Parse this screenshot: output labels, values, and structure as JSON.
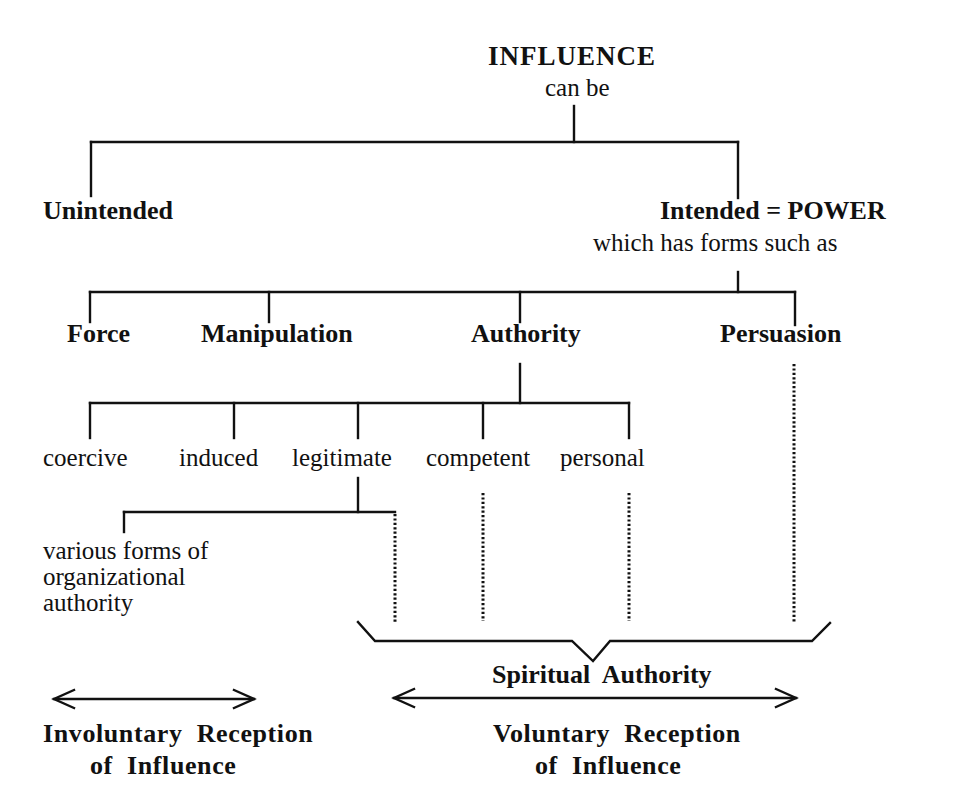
{
  "diagram": {
    "root": {
      "title": "INFLUENCE",
      "subtitle": "can be"
    },
    "level1": {
      "unintended": "Unintended",
      "intended": "Intended = POWER",
      "intended_subtitle": "which has forms such as"
    },
    "forms": [
      {
        "label": "Force"
      },
      {
        "label": "Manipulation"
      },
      {
        "label": "Authority"
      },
      {
        "label": "Persuasion"
      }
    ],
    "authority_types": [
      {
        "label": "coercive"
      },
      {
        "label": "induced"
      },
      {
        "label": "legitimate"
      },
      {
        "label": "competent"
      },
      {
        "label": "personal"
      }
    ],
    "legitimate_child": {
      "line1": "various forms of",
      "line2": "organizational",
      "line3": "authority"
    },
    "bracket_label": "Spiritual  Authority",
    "ranges": {
      "involuntary": {
        "line1": "Involuntary  Reception",
        "line2": "of  Influence"
      },
      "voluntary": {
        "line1": "Voluntary  Reception",
        "line2": "of  Influence"
      }
    },
    "colors": {
      "line": "#111111",
      "background": "#ffffff"
    }
  }
}
